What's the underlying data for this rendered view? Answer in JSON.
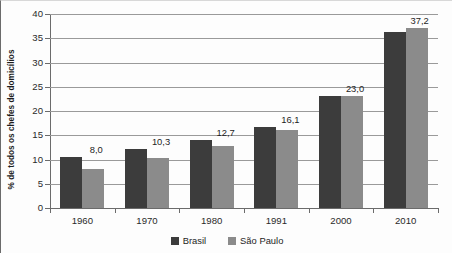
{
  "chart_data": {
    "type": "bar",
    "title": "",
    "subtitle": "",
    "xlabel": "",
    "ylabel": "% de todos os chefes de domicílios",
    "categories": [
      "1960",
      "1970",
      "1980",
      "1991",
      "2000",
      "2010"
    ],
    "ylim": [
      0,
      40
    ],
    "yticks": [
      0,
      5,
      10,
      15,
      20,
      25,
      30,
      35,
      40
    ],
    "ytick_labels": [
      "0",
      "5",
      "10",
      "15",
      "20",
      "25",
      "30",
      "35",
      "40"
    ],
    "grid": true,
    "legend_position": "bottom",
    "series": [
      {
        "name": "Brasil",
        "color": "#3c3c3c",
        "values": [
          10.5,
          12.2,
          14.1,
          16.8,
          23.0,
          36.3
        ]
      },
      {
        "name": "São Paulo",
        "color": "#8b8b8b",
        "values": [
          8.0,
          10.3,
          12.7,
          16.1,
          23.0,
          37.2
        ]
      }
    ],
    "point_labels": [
      "8,0",
      "10,3",
      "12,7",
      "16,1",
      "23,0",
      "37,2"
    ],
    "annotations": []
  },
  "legend": {
    "items": [
      {
        "label": "Brasil",
        "color": "#3c3c3c"
      },
      {
        "label": "São Paulo",
        "color": "#8b8b8b"
      }
    ]
  },
  "colors": {
    "brasil": "#3c3c3c",
    "sao_paulo": "#8b8b8b",
    "grid": "#9a9a9a",
    "axis": "#6b6b6b",
    "text": "#1d1d1d",
    "background": "#fdfdfd"
  }
}
